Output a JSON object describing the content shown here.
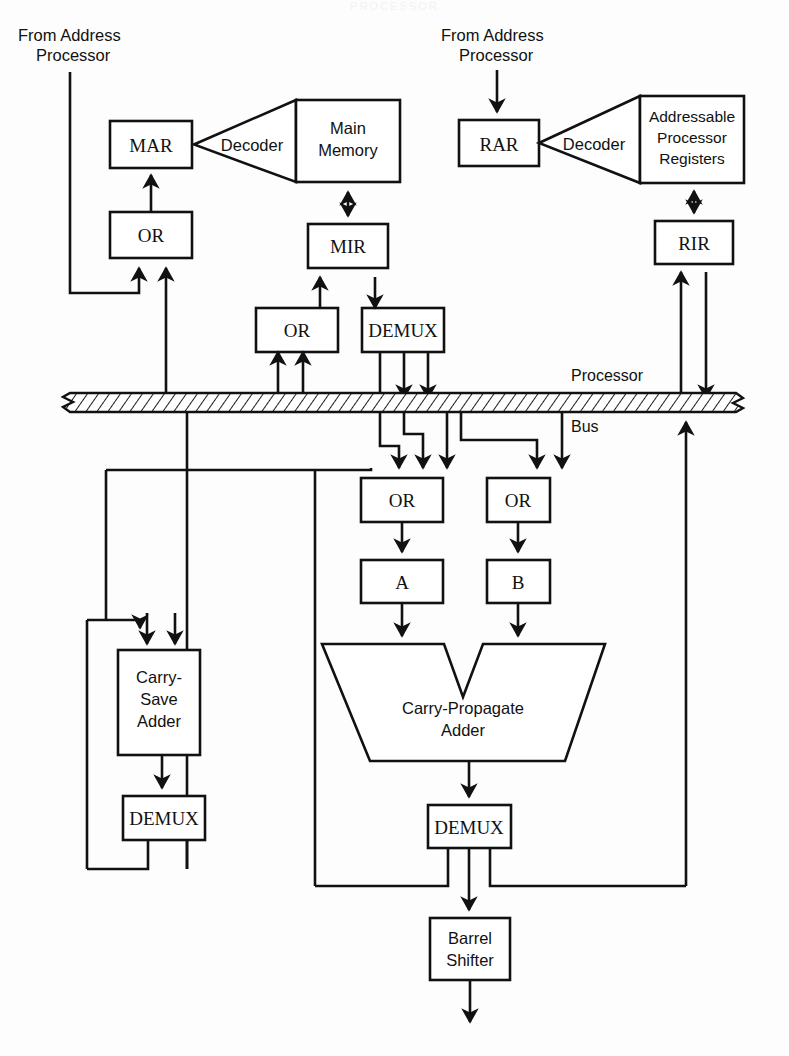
{
  "figure": {
    "ghost_header": "PROCESSOR",
    "ink_color": "#111111",
    "paper_color": "#fdfdfd"
  },
  "labels": {
    "from_address_processor_left_line1": "From Address",
    "from_address_processor_left_line2": "Processor",
    "from_address_processor_right_line1": "From Address",
    "from_address_processor_right_line2": "Processor",
    "bus_line1": "Processor",
    "bus_line2": "Bus"
  },
  "blocks": {
    "mar": "MAR",
    "or_mar": "OR",
    "decoder_memory": "Decoder",
    "main_memory_line1": "Main",
    "main_memory_line2": "Memory",
    "mir": "MIR",
    "or_mir": "OR",
    "demux_mir": "DEMUX",
    "rar": "RAR",
    "decoder_registers": "Decoder",
    "registers_line1": "Addressable",
    "registers_line2": "Processor",
    "registers_line3": "Registers",
    "rir": "RIR",
    "or_a": "OR",
    "or_b": "OR",
    "reg_a": "A",
    "reg_b": "B",
    "cpa_line1": "Carry-Propagate",
    "cpa_line2": "Adder",
    "csa_line1": "Carry-",
    "csa_line2": "Save",
    "csa_line3": "Adder",
    "demux_csa": "DEMUX",
    "demux_cpa": "DEMUX",
    "barrel_line1": "Barrel",
    "barrel_line2": "Shifter"
  }
}
